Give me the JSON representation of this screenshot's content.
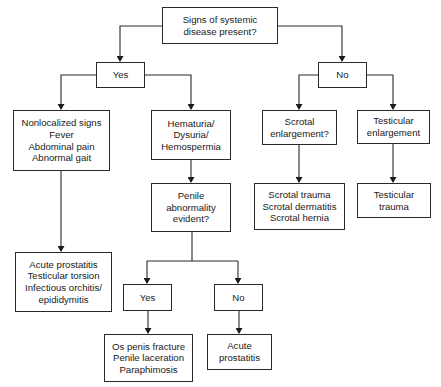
{
  "diagram": {
    "type": "flowchart",
    "nodes": {
      "root": {
        "lines": [
          "Signs of systemic",
          "disease present?"
        ]
      },
      "yes1": {
        "lines": [
          "Yes"
        ]
      },
      "no1": {
        "lines": [
          "No"
        ]
      },
      "nonlocalized": {
        "lines": [
          "Nonlocalized signs",
          "Fever",
          "Abdominal pain",
          "Abnormal gait"
        ]
      },
      "hematuria": {
        "lines": [
          "Hematuria/",
          "Dysuria/",
          "Hemospermia"
        ]
      },
      "scrotal_q": {
        "lines": [
          "Scrotal",
          "enlargement?"
        ]
      },
      "testicular_enl": {
        "lines": [
          "Testicular",
          "enlargement"
        ]
      },
      "penile_q": {
        "lines": [
          "Penile",
          "abnormality",
          "evident?"
        ]
      },
      "scrotal_dx": {
        "lines": [
          "Scrotal trauma",
          "Scrotal dermatitis",
          "Scrotal hernia"
        ]
      },
      "testicular_dx": {
        "lines": [
          "Testicular",
          "trauma"
        ]
      },
      "systemic_dx": {
        "lines": [
          "Acute prostatitis",
          "Testicular torsion",
          "Infectious orchitis/",
          "epididymitis"
        ]
      },
      "yes2": {
        "lines": [
          "Yes"
        ]
      },
      "no2": {
        "lines": [
          "No"
        ]
      },
      "penile_dx": {
        "lines": [
          "Os penis fracture",
          "Penile laceration",
          "Paraphimosis"
        ]
      },
      "prostatitis_dx": {
        "lines": [
          "Acute",
          "prostatitis"
        ]
      }
    },
    "edges": [
      [
        "root",
        "yes1"
      ],
      [
        "root",
        "no1"
      ],
      [
        "yes1",
        "nonlocalized"
      ],
      [
        "yes1",
        "hematuria"
      ],
      [
        "no1",
        "scrotal_q"
      ],
      [
        "no1",
        "testicular_enl"
      ],
      [
        "nonlocalized",
        "systemic_dx"
      ],
      [
        "hematuria",
        "penile_q"
      ],
      [
        "scrotal_q",
        "scrotal_dx"
      ],
      [
        "testicular_enl",
        "testicular_dx"
      ],
      [
        "penile_q",
        "yes2"
      ],
      [
        "penile_q",
        "no2"
      ],
      [
        "yes2",
        "penile_dx"
      ],
      [
        "no2",
        "prostatitis_dx"
      ]
    ]
  }
}
